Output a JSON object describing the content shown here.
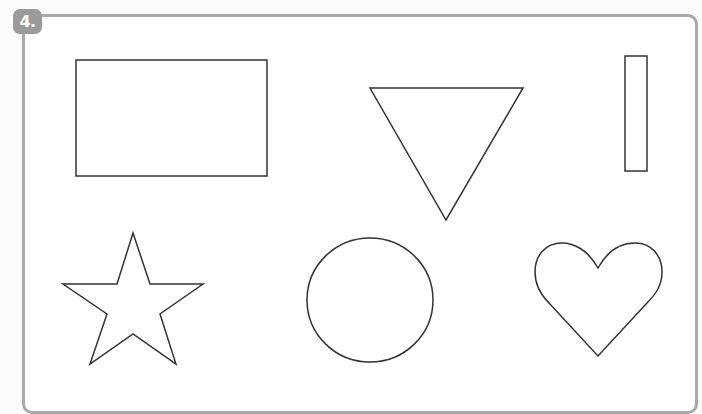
{
  "exercise": {
    "number_label": "4.",
    "badge_color": "#9a9a9a",
    "frame_color": "#a9a9a9"
  },
  "shapes": [
    {
      "name": "rectangle",
      "label": "Rectangle"
    },
    {
      "name": "triangle",
      "label": "Inverted triangle"
    },
    {
      "name": "narrow-rectangle",
      "label": "Narrow vertical rectangle"
    },
    {
      "name": "star",
      "label": "Five-pointed star"
    },
    {
      "name": "circle",
      "label": "Circle"
    },
    {
      "name": "heart",
      "label": "Heart"
    }
  ],
  "outline_color": "#333333"
}
